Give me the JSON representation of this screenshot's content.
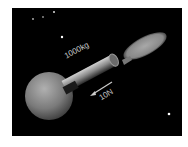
{
  "diagram": {
    "type": "physics-illustration",
    "labels": {
      "mass": "1000kg",
      "force": "10N"
    },
    "colors": {
      "background": "#000000",
      "body": "#8a8a8a",
      "exhaust": "#9a9a9a",
      "text": "#c8c8c8",
      "stars": "#ffffff"
    }
  }
}
